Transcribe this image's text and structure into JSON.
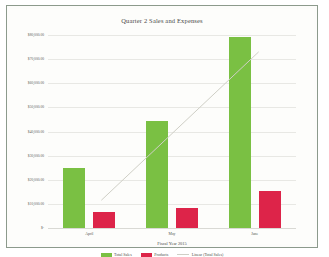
{
  "chart_data": {
    "type": "bar",
    "title": "Quarter 2 Sales and Expenses",
    "xlabel": "Fiscal Year 2015",
    "ylabel": "",
    "categories": [
      "April",
      "May",
      "June"
    ],
    "series": [
      {
        "name": "Total Sales",
        "values": [
          25000,
          44500,
          79000
        ],
        "color": "#7ac043"
      },
      {
        "name": "Products",
        "values": [
          6500,
          8500,
          15500
        ],
        "color": "#dd2449"
      }
    ],
    "trendline": {
      "name": "Linear (Total Sales)",
      "color": "#cfcfc6",
      "start_value": 11500,
      "end_value": 73000
    },
    "ylim": [
      0,
      80000
    ],
    "ytick_values": [
      0,
      10000,
      20000,
      30000,
      40000,
      50000,
      60000,
      70000,
      80000
    ],
    "ytick_labels": [
      "$-",
      "$10,000.00",
      "$20,000.00",
      "$30,000.00",
      "$40,000.00",
      "$50,000.00",
      "$60,000.00",
      "$70,000.00",
      "$80,000.00"
    ],
    "grid": true,
    "legend_position": "bottom"
  },
  "legend": {
    "entries": [
      {
        "label": "Total Sales",
        "marker": "bar",
        "color": "#7ac043"
      },
      {
        "label": "Products",
        "marker": "bar",
        "color": "#dd2449"
      },
      {
        "label": "Linear (Total Sales)",
        "marker": "line",
        "color": "#cfcfc6"
      }
    ]
  }
}
